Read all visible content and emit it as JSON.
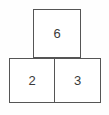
{
  "figure": {
    "name": "number-pyramid",
    "type": "addition-pyramid",
    "background_color": "#ffffff",
    "border_color": "#555555",
    "text_color": "#3a3a3a"
  },
  "chart_data": {
    "type": "table",
    "title": "",
    "xlabel": "",
    "ylabel": "",
    "rows": [
      {
        "level": "top",
        "cells": [
          {
            "label": "6",
            "value": 6
          }
        ]
      },
      {
        "level": "bottom",
        "cells": [
          {
            "label": "2",
            "value": 2
          },
          {
            "label": "3",
            "value": 3
          }
        ]
      }
    ],
    "values": [
      6,
      2,
      3
    ],
    "categories": [
      "top",
      "bottom-left",
      "bottom-right"
    ]
  },
  "cells": {
    "top": {
      "value": "6"
    },
    "bottom_left": {
      "value": "2"
    },
    "bottom_right": {
      "value": "3"
    }
  }
}
